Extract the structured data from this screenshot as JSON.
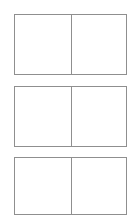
{
  "page": {
    "background_color": "#ffffff",
    "width": 136,
    "height": 222
  },
  "style": {
    "border_color": "#8f8f8f",
    "border_width_px": 1,
    "fill_color": "#ffffff",
    "divider_color": "#8f8f8f"
  },
  "frames": [
    {
      "id": "frame-1",
      "label": "",
      "panes": [
        {
          "id": "frame-1-pane-left",
          "label": ""
        },
        {
          "id": "frame-1-pane-right",
          "label": ""
        }
      ]
    },
    {
      "id": "frame-2",
      "label": "",
      "panes": [
        {
          "id": "frame-2-pane-left",
          "label": ""
        },
        {
          "id": "frame-2-pane-right",
          "label": ""
        }
      ]
    },
    {
      "id": "frame-3",
      "label": "",
      "panes": [
        {
          "id": "frame-3-pane-left",
          "label": ""
        },
        {
          "id": "frame-3-pane-right",
          "label": ""
        }
      ]
    }
  ]
}
